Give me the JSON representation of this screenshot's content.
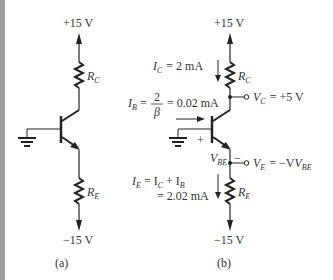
{
  "figure": {
    "panel_a": {
      "caption": "(a)",
      "supply_top": "+15 V",
      "supply_bottom": "−15 V",
      "rc_label": "R",
      "rc_sub": "C",
      "re_label": "R",
      "re_sub": "E"
    },
    "panel_b": {
      "caption": "(b)",
      "supply_top": "+15 V",
      "supply_bottom": "−15 V",
      "rc_label": "R",
      "rc_sub": "C",
      "re_label": "R",
      "re_sub": "E",
      "ic_label": "I",
      "ic_sub": "C",
      "ic_value": "= 2 mA",
      "ib_label": "I",
      "ib_sub": "B",
      "ib_eq": "=",
      "ib_num": "2",
      "ib_den": "β",
      "ib_value": "= 0.02 mA",
      "vbe_plus": "+",
      "vbe_minus": "−",
      "vbe_label": "V",
      "vbe_sub": "BE",
      "vc_label": "V",
      "vc_sub": "C",
      "vc_value": "= +5 V",
      "ve_label": "V",
      "ve_sub": "E",
      "ve_value": "= −V",
      "ve_value_sub": "BE",
      "ie_label": "I",
      "ie_sub": "E",
      "ie_eq1": "= I",
      "ie_eq1_sub": "C",
      "ie_plus": "+ I",
      "ie_plus_sub": "B",
      "ie_value": "= 2.02 mA"
    },
    "colors": {
      "line": "#222222",
      "text": "#333333",
      "border": "#9e9e9e"
    }
  }
}
